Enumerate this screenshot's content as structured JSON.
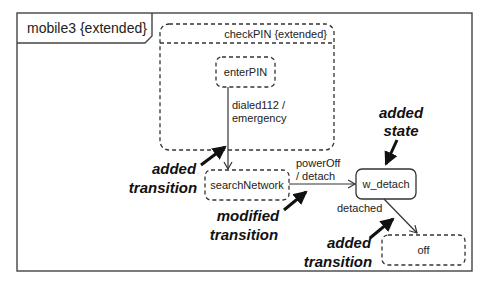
{
  "frame": {
    "title": "mobile3 {extended}"
  },
  "states": {
    "checkPIN": {
      "label": "checkPIN  {extended}",
      "style": "dashed"
    },
    "enterPIN": {
      "label": "enterPIN",
      "style": "dashed"
    },
    "searchNetwork": {
      "label": "searchNetwork",
      "style": "dashed"
    },
    "w_detach": {
      "label": "w_detach",
      "style": "solid"
    },
    "off": {
      "label": "off",
      "style": "dashed"
    }
  },
  "transitions": [
    {
      "from": "enterPIN",
      "to": "searchNetwork",
      "label_line1": "dialed112 /",
      "label_line2": "emergency"
    },
    {
      "from": "searchNetwork",
      "to": "w_detach",
      "label_line1": "powerOff",
      "label_line2": "/ detach"
    },
    {
      "from": "w_detach",
      "to": "off",
      "label_line1": "detached"
    }
  ],
  "annotations": {
    "added_state": {
      "line1": "added",
      "line2": "state"
    },
    "added_transition_1": {
      "line1": "added",
      "line2": "transition"
    },
    "modified_transition": {
      "line1": "modified",
      "line2": "transition"
    },
    "added_transition_2": {
      "line1": "added",
      "line2": "transition"
    }
  }
}
